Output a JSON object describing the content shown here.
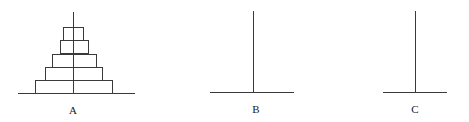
{
  "diagram": {
    "type": "tower-of-hanoi",
    "line_color": "#3a3a3a",
    "pegs": [
      {
        "label": "A",
        "x": 73,
        "base_x1": 18,
        "base_x2": 135,
        "top_y": 12,
        "base_y": 93,
        "disks": 5
      },
      {
        "label": "B",
        "x": 253,
        "base_x1": 210,
        "base_x2": 294,
        "top_y": 11,
        "base_y": 92,
        "disks": 0
      },
      {
        "label": "C",
        "x": 415,
        "base_x1": 383,
        "base_x2": 447,
        "top_y": 11,
        "base_y": 92,
        "disks": 0
      }
    ],
    "disks": [
      {
        "x1": 63,
        "x2": 83,
        "y1": 27,
        "y2": 40
      },
      {
        "x1": 60,
        "x2": 88,
        "y1": 40,
        "y2": 54
      },
      {
        "x1": 52,
        "x2": 96,
        "y1": 54,
        "y2": 67
      },
      {
        "x1": 45,
        "x2": 102,
        "y1": 67,
        "y2": 80
      },
      {
        "x1": 35,
        "x2": 112,
        "y1": 80,
        "y2": 93
      }
    ]
  }
}
